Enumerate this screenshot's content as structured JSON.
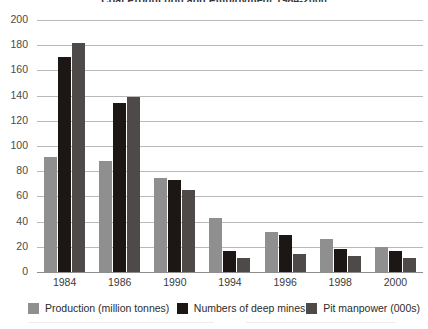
{
  "chart_data": {
    "type": "bar",
    "title": "Coal Production and Employment 1984-2000",
    "xlabel": "",
    "ylabel": "",
    "ylim": [
      0,
      200
    ],
    "yticks": [
      0,
      20,
      40,
      60,
      80,
      100,
      120,
      140,
      160,
      180,
      200
    ],
    "grid": true,
    "legend_position": "bottom",
    "categories": [
      "1984",
      "1986",
      "1990",
      "1994",
      "1996",
      "1998",
      "2000"
    ],
    "series": [
      {
        "name": "Production (million tonnes)",
        "color": "#8f8f8f",
        "values": [
          91,
          88,
          75,
          43,
          32,
          26,
          20
        ]
      },
      {
        "name": "Numbers of deep mines",
        "color": "#1c1715",
        "values": [
          171,
          134,
          73,
          17,
          29,
          18,
          17
        ]
      },
      {
        "name": "Pit manpower (000s)",
        "color": "#4e4a49",
        "values": [
          182,
          139,
          65,
          11,
          14,
          13,
          11
        ]
      }
    ]
  },
  "legend": {
    "items": [
      {
        "label": "Production (million tonnes)",
        "color": "#8f8f8f"
      },
      {
        "label": "Numbers of deep mines",
        "color": "#1c1715"
      },
      {
        "label": "Pit manpower (000s)",
        "color": "#4e4a49"
      }
    ]
  }
}
